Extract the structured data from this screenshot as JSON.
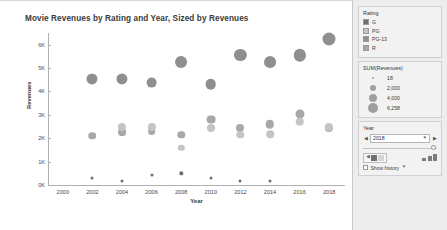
{
  "chart": {
    "title": "Movie Revenues by Rating and Year, Sized by Revenues",
    "xlabel": "Year",
    "ylabel": "Revenues"
  },
  "chart_data": {
    "type": "scatter",
    "title": "Movie Revenues by Rating and Year, Sized by Revenues",
    "xlabel": "Year",
    "ylabel": "Revenues",
    "xlim": [
      1999,
      2019
    ],
    "ylim": [
      0,
      6500
    ],
    "xticks": [
      2000,
      2002,
      2004,
      2006,
      2008,
      2010,
      2012,
      2014,
      2016,
      2018
    ],
    "yticks": [
      0,
      1000,
      2000,
      3000,
      4000,
      5000,
      6000
    ],
    "ytick_labels": [
      "0K",
      "1K",
      "2K",
      "3K",
      "4K",
      "5K",
      "6K"
    ],
    "grid": false,
    "legend_position": "right",
    "size_encoding": "SUM(Revenues)",
    "color_encoding": "Rating",
    "series": [
      {
        "name": "PG-13",
        "color": "#8f8f8f",
        "points": [
          {
            "x": 2002,
            "y": 4550,
            "size": 4550
          },
          {
            "x": 2004,
            "y": 4550,
            "size": 4600
          },
          {
            "x": 2006,
            "y": 4380,
            "size": 4300
          },
          {
            "x": 2008,
            "y": 5250,
            "size": 5250
          },
          {
            "x": 2010,
            "y": 4300,
            "size": 4150
          },
          {
            "x": 2012,
            "y": 5550,
            "size": 5550
          },
          {
            "x": 2014,
            "y": 5250,
            "size": 5200
          },
          {
            "x": 2016,
            "y": 5550,
            "size": 5600
          },
          {
            "x": 2018,
            "y": 6258,
            "size": 6258
          }
        ]
      },
      {
        "name": "R",
        "color": "#a8a8a8",
        "points": [
          {
            "x": 2002,
            "y": 2100,
            "size": 2100
          },
          {
            "x": 2004,
            "y": 2280,
            "size": 2300
          },
          {
            "x": 2006,
            "y": 2300,
            "size": 2250
          },
          {
            "x": 2008,
            "y": 2150,
            "size": 2000
          },
          {
            "x": 2010,
            "y": 2800,
            "size": 2850
          },
          {
            "x": 2012,
            "y": 2450,
            "size": 2400
          },
          {
            "x": 2014,
            "y": 2600,
            "size": 2650
          },
          {
            "x": 2016,
            "y": 3050,
            "size": 3050
          },
          {
            "x": 2018,
            "y": 2450,
            "size": 2500
          }
        ]
      },
      {
        "name": "PG",
        "color": "#c4c4c4",
        "points": [
          {
            "x": 2004,
            "y": 2480,
            "size": 2500
          },
          {
            "x": 2006,
            "y": 2500,
            "size": 2450
          },
          {
            "x": 2008,
            "y": 1600,
            "size": 1500
          },
          {
            "x": 2010,
            "y": 2450,
            "size": 2400
          },
          {
            "x": 2012,
            "y": 2150,
            "size": 2050
          },
          {
            "x": 2014,
            "y": 2180,
            "size": 2100
          },
          {
            "x": 2016,
            "y": 2700,
            "size": 2700
          },
          {
            "x": 2018,
            "y": 2500,
            "size": 2500
          }
        ]
      },
      {
        "name": "G",
        "color": "#6f6f6f",
        "points": [
          {
            "x": 2002,
            "y": 280,
            "size": 200
          },
          {
            "x": 2004,
            "y": 180,
            "size": 120
          },
          {
            "x": 2006,
            "y": 420,
            "size": 330
          },
          {
            "x": 2008,
            "y": 500,
            "size": 420
          },
          {
            "x": 2010,
            "y": 300,
            "size": 230
          },
          {
            "x": 2012,
            "y": 190,
            "size": 140
          },
          {
            "x": 2014,
            "y": 170,
            "size": 110
          }
        ]
      }
    ]
  },
  "panel": {
    "rating_legend": {
      "title": "Rating",
      "items": [
        {
          "label": "G",
          "color": "#6f6f6f"
        },
        {
          "label": "PG",
          "color": "#c4c4c4"
        },
        {
          "label": "PG-13",
          "color": "#8f8f8f"
        },
        {
          "label": "R",
          "color": "#a8a8a8"
        }
      ]
    },
    "size_legend": {
      "title": "SUM(Revenues)",
      "items": [
        {
          "label": "18",
          "diameter": 2
        },
        {
          "label": "2,000",
          "diameter": 6
        },
        {
          "label": "4,000",
          "diameter": 8
        },
        {
          "label": "6,258",
          "diameter": 10
        }
      ]
    },
    "year_filter": {
      "title": "Year",
      "value": "2018",
      "prev_icon": "chevron-left-icon",
      "next_icon": "chevron-right-icon",
      "dropdown_icon": "chevron-down-icon"
    },
    "playback": {
      "show_history_label": "Show history",
      "back_icon": "step-back-icon",
      "play_icon": "play-icon",
      "forward_icon": "step-forward-icon",
      "speed_icon": "speed-icon",
      "history_dropdown_icon": "chevron-down-icon"
    }
  }
}
